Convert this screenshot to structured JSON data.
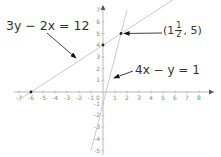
{
  "diagram": {
    "title": "",
    "axes": {
      "x_ticks": [
        "-7",
        "-6",
        "-5",
        "-4",
        "-3",
        "-2",
        "-1",
        "0",
        "1",
        "2",
        "3",
        "4",
        "5",
        "6",
        "7",
        "8"
      ],
      "y_ticks": [
        "-5",
        "-4",
        "-3",
        "-2",
        "-1",
        "1",
        "2",
        "3",
        "4",
        "5",
        "6",
        "7"
      ],
      "x_label": "x",
      "y_label": "y"
    },
    "lines": [
      {
        "name": "line-1",
        "equation": "3y − 2x = 12",
        "points": [
          [
            -7,
            -0.67
          ],
          [
            8.5,
            9.67
          ]
        ],
        "color": "#bdbdbd"
      },
      {
        "name": "line-2",
        "equation": "4x − y = 1",
        "points": [
          [
            -1,
            -5
          ],
          [
            2,
            7
          ]
        ],
        "color": "#bdbdbd"
      }
    ],
    "labels": {
      "eq1": "3y − 2x = 12",
      "eq2": "4x − y = 1",
      "intersection_prefix": "(1",
      "intersection_num": "1",
      "intersection_den": "2",
      "intersection_suffix": ", 5)"
    },
    "intersection": {
      "x": 1.5,
      "y": 5
    },
    "marked_points": [
      [
        -6,
        0
      ],
      [
        0,
        4
      ],
      [
        1.5,
        5
      ]
    ]
  }
}
